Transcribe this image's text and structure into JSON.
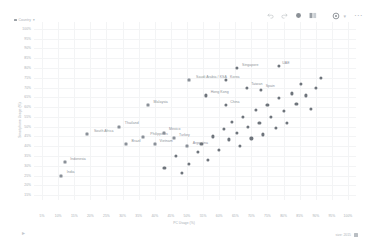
{
  "toolbar": {
    "items": [
      {
        "name": "undo-icon",
        "glyph": "↶"
      },
      {
        "name": "redo-icon",
        "glyph": "↷"
      },
      {
        "name": "filter-icon",
        "glyph": "●"
      },
      {
        "name": "columns-icon",
        "glyph": "▤"
      },
      {
        "name": "settings-icon",
        "glyph": "⚙"
      }
    ],
    "more_label": "⋯",
    "caret": "▾"
  },
  "legend": {
    "label": "Country"
  },
  "footer": {
    "left_glyph": "▸",
    "right_label": "size: 2015"
  },
  "chart_data": {
    "type": "scatter",
    "title": "",
    "xlabel": "PC Usage (%)",
    "ylabel": "Smartphone Usage (%)",
    "xlim": [
      2.5,
      102.5
    ],
    "ylim": [
      12.5,
      102.5
    ],
    "grid": true,
    "legend_position": "top-left",
    "xticks": [
      "5%",
      "10%",
      "15%",
      "20%",
      "25%",
      "30%",
      "35%",
      "40%",
      "45%",
      "50%",
      "55%",
      "60%",
      "65%",
      "70%",
      "75%",
      "80%",
      "85%",
      "90%",
      "95%",
      "100%"
    ],
    "yticks": [
      "100%",
      "95%",
      "90%",
      "85%",
      "80%",
      "75%",
      "70%",
      "65%",
      "60%",
      "55%",
      "50%",
      "45%",
      "40%",
      "35%",
      "30%",
      "25%",
      "20%",
      "15%"
    ],
    "points": [
      {
        "label": "India",
        "x": 11.0,
        "y": 25.0,
        "marker": "square"
      },
      {
        "label": "Indonesia",
        "x": 12.0,
        "y": 32.0,
        "marker": "square"
      },
      {
        "label": "South Africa",
        "x": 19.0,
        "y": 46.0,
        "marker": "square"
      },
      {
        "label": "Thailand",
        "x": 29.0,
        "y": 50.0,
        "marker": "square"
      },
      {
        "label": "Malaysia",
        "x": 38.0,
        "y": 61.0,
        "marker": "square"
      },
      {
        "label": "Brazil",
        "x": 31.0,
        "y": 41.0,
        "marker": "square"
      },
      {
        "label": "Philippines",
        "x": 36.5,
        "y": 44.5,
        "marker": "square"
      },
      {
        "label": "Vietnam",
        "x": 40.0,
        "y": 41.0,
        "marker": "square"
      },
      {
        "label": "Mexico",
        "x": 43.0,
        "y": 47.0,
        "marker": "square"
      },
      {
        "label": "Turkey",
        "x": 46.0,
        "y": 44.0,
        "marker": "square"
      },
      {
        "label": "Argentina",
        "x": 50.0,
        "y": 40.0,
        "marker": "square"
      },
      {
        "label": "Saudi Arabia / KSA",
        "x": 50.5,
        "y": 74.0,
        "marker": "square"
      },
      {
        "label": "Hong Kong",
        "x": 56.0,
        "y": 66.0,
        "marker": "circle"
      },
      {
        "label": "Korea",
        "x": 62.0,
        "y": 74.0,
        "marker": "circle"
      },
      {
        "label": "China",
        "x": 62.0,
        "y": 61.0,
        "marker": "circle"
      },
      {
        "label": "Singapore",
        "x": 65.5,
        "y": 80.0,
        "marker": "circle"
      },
      {
        "label": "Taiwan",
        "x": 68.5,
        "y": 70.0,
        "marker": "circle"
      },
      {
        "label": "Spain",
        "x": 73.0,
        "y": 69.0,
        "marker": "circle"
      },
      {
        "label": "UAE",
        "x": 78.5,
        "y": 81.0,
        "marker": "circle"
      },
      {
        "label": "",
        "x": 46.5,
        "y": 35.0,
        "marker": "circle"
      },
      {
        "label": "",
        "x": 50.5,
        "y": 31.0,
        "marker": "circle"
      },
      {
        "label": "",
        "x": 53.5,
        "y": 37.0,
        "marker": "circle"
      },
      {
        "label": "",
        "x": 54.5,
        "y": 41.0,
        "marker": "circle"
      },
      {
        "label": "",
        "x": 56.5,
        "y": 33.0,
        "marker": "circle"
      },
      {
        "label": "",
        "x": 58.0,
        "y": 45.0,
        "marker": "circle"
      },
      {
        "label": "",
        "x": 60.0,
        "y": 38.0,
        "marker": "circle"
      },
      {
        "label": "",
        "x": 61.5,
        "y": 49.0,
        "marker": "circle"
      },
      {
        "label": "",
        "x": 63.0,
        "y": 43.5,
        "marker": "circle"
      },
      {
        "label": "",
        "x": 64.0,
        "y": 52.5,
        "marker": "circle"
      },
      {
        "label": "",
        "x": 65.5,
        "y": 47.0,
        "marker": "circle"
      },
      {
        "label": "",
        "x": 66.5,
        "y": 40.0,
        "marker": "circle"
      },
      {
        "label": "",
        "x": 67.5,
        "y": 55.0,
        "marker": "circle"
      },
      {
        "label": "",
        "x": 69.0,
        "y": 50.0,
        "marker": "circle"
      },
      {
        "label": "",
        "x": 70.0,
        "y": 44.0,
        "marker": "circle"
      },
      {
        "label": "",
        "x": 71.5,
        "y": 58.5,
        "marker": "circle"
      },
      {
        "label": "",
        "x": 72.5,
        "y": 52.0,
        "marker": "circle"
      },
      {
        "label": "",
        "x": 73.5,
        "y": 46.0,
        "marker": "circle"
      },
      {
        "label": "",
        "x": 75.0,
        "y": 61.0,
        "marker": "circle"
      },
      {
        "label": "",
        "x": 76.0,
        "y": 55.0,
        "marker": "circle"
      },
      {
        "label": "",
        "x": 77.5,
        "y": 49.5,
        "marker": "circle"
      },
      {
        "label": "",
        "x": 78.5,
        "y": 64.5,
        "marker": "circle"
      },
      {
        "label": "",
        "x": 80.0,
        "y": 58.0,
        "marker": "circle"
      },
      {
        "label": "",
        "x": 81.0,
        "y": 52.0,
        "marker": "circle"
      },
      {
        "label": "",
        "x": 82.5,
        "y": 67.0,
        "marker": "circle"
      },
      {
        "label": "",
        "x": 84.0,
        "y": 61.5,
        "marker": "circle"
      },
      {
        "label": "",
        "x": 85.5,
        "y": 72.0,
        "marker": "circle"
      },
      {
        "label": "",
        "x": 87.0,
        "y": 66.0,
        "marker": "circle"
      },
      {
        "label": "",
        "x": 88.5,
        "y": 59.0,
        "marker": "circle"
      },
      {
        "label": "",
        "x": 90.0,
        "y": 70.0,
        "marker": "circle"
      },
      {
        "label": "",
        "x": 91.5,
        "y": 75.0,
        "marker": "circle"
      },
      {
        "label": "",
        "x": 43.0,
        "y": 29.0,
        "marker": "circle"
      },
      {
        "label": "",
        "x": 48.5,
        "y": 26.5,
        "marker": "circle"
      }
    ]
  }
}
